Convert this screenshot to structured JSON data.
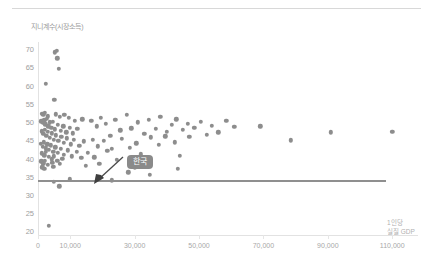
{
  "chart_data": {
    "type": "scatter",
    "title": "",
    "ylabel": "지니계수(시장소득)",
    "xlabel_lines": [
      "1인당",
      "실질 GDP"
    ],
    "xlabel": "1인당 실질 GDP",
    "xlim": [
      0,
      118000
    ],
    "ylim": [
      19,
      72
    ],
    "yticks": [
      70,
      65,
      60,
      55,
      50,
      45,
      40,
      35,
      30,
      25,
      20
    ],
    "xticks": [
      0,
      10000,
      30000,
      50000,
      70000,
      90000,
      110000
    ],
    "xticklabels": [
      "0",
      "10,000",
      "30,000",
      "50,000",
      "70,000",
      "90,000",
      "110,000"
    ],
    "grid": false,
    "legend": "none",
    "point_color": "#8d8d8d",
    "reference_line": {
      "orientation": "horizontal",
      "value": 34,
      "color": "#8f8f8f",
      "x_from": 0,
      "x_to": 108000
    },
    "annotations": [
      {
        "label": "한국",
        "target_x": 23000,
        "target_y": 34,
        "badge_color": "#8a8a8a",
        "text_color": "#ffffff"
      }
    ],
    "points": [
      [
        5200,
        69.2
      ],
      [
        5800,
        69.6
      ],
      [
        6000,
        67.5
      ],
      [
        6400,
        64.7
      ],
      [
        2400,
        60.6
      ],
      [
        5100,
        56.2
      ],
      [
        1300,
        52.3
      ],
      [
        1700,
        52.0
      ],
      [
        2200,
        52.5
      ],
      [
        3000,
        51.6
      ],
      [
        5500,
        52.1
      ],
      [
        6700,
        51.5
      ],
      [
        8200,
        52.0
      ],
      [
        9500,
        51.2
      ],
      [
        11500,
        50.3
      ],
      [
        13800,
        50.8
      ],
      [
        1000,
        50.2
      ],
      [
        1500,
        49.8
      ],
      [
        1900,
        50.5
      ],
      [
        2300,
        49.4
      ],
      [
        2700,
        50.9
      ],
      [
        3200,
        48.8
      ],
      [
        3600,
        49.9
      ],
      [
        4100,
        48.4
      ],
      [
        4600,
        50.1
      ],
      [
        5300,
        48.0
      ],
      [
        6100,
        49.3
      ],
      [
        7000,
        47.6
      ],
      [
        7800,
        48.9
      ],
      [
        8800,
        47.2
      ],
      [
        9800,
        48.5
      ],
      [
        10800,
        46.9
      ],
      [
        12200,
        48.2
      ],
      [
        1100,
        47.5
      ],
      [
        1600,
        46.8
      ],
      [
        2100,
        47.9
      ],
      [
        2600,
        46.2
      ],
      [
        3100,
        47.3
      ],
      [
        3700,
        45.7
      ],
      [
        4300,
        46.9
      ],
      [
        4900,
        45.2
      ],
      [
        5600,
        46.4
      ],
      [
        6300,
        44.8
      ],
      [
        7200,
        46.0
      ],
      [
        8000,
        44.3
      ],
      [
        9000,
        45.6
      ],
      [
        10200,
        43.9
      ],
      [
        11200,
        45.1
      ],
      [
        12800,
        43.5
      ],
      [
        14200,
        44.7
      ],
      [
        900,
        44.0
      ],
      [
        1400,
        43.3
      ],
      [
        1800,
        44.5
      ],
      [
        2400,
        42.8
      ],
      [
        2900,
        43.9
      ],
      [
        3400,
        42.4
      ],
      [
        4000,
        43.6
      ],
      [
        4700,
        41.9
      ],
      [
        5400,
        43.1
      ],
      [
        6200,
        41.5
      ],
      [
        7100,
        42.7
      ],
      [
        8100,
        41.0
      ],
      [
        9200,
        42.3
      ],
      [
        10500,
        40.6
      ],
      [
        12000,
        41.8
      ],
      [
        13500,
        40.2
      ],
      [
        1200,
        41.4
      ],
      [
        1900,
        40.9
      ],
      [
        2500,
        41.9
      ],
      [
        3300,
        40.4
      ],
      [
        4200,
        39.8
      ],
      [
        5000,
        40.6
      ],
      [
        6000,
        39.3
      ],
      [
        7500,
        40.0
      ],
      [
        1000,
        39.2
      ],
      [
        1600,
        38.7
      ],
      [
        2200,
        39.4
      ],
      [
        3000,
        38.2
      ],
      [
        4500,
        38.9
      ],
      [
        6800,
        38.5
      ],
      [
        1300,
        37.6
      ],
      [
        2000,
        37.1
      ],
      [
        4800,
        37.8
      ],
      [
        16500,
        50.4
      ],
      [
        18200,
        48.8
      ],
      [
        19500,
        51.2
      ],
      [
        21000,
        49.5
      ],
      [
        22500,
        46.3
      ],
      [
        24000,
        50.7
      ],
      [
        25500,
        47.8
      ],
      [
        27500,
        52.0
      ],
      [
        29000,
        48.3
      ],
      [
        31000,
        49.9
      ],
      [
        33000,
        46.8
      ],
      [
        34500,
        50.6
      ],
      [
        36500,
        48.1
      ],
      [
        38000,
        51.5
      ],
      [
        40000,
        47.4
      ],
      [
        41500,
        49.2
      ],
      [
        43000,
        50.8
      ],
      [
        45000,
        47.9
      ],
      [
        46500,
        49.6
      ],
      [
        48500,
        48.4
      ],
      [
        50500,
        50.1
      ],
      [
        52500,
        46.5
      ],
      [
        54000,
        49.0
      ],
      [
        56000,
        47.2
      ],
      [
        58500,
        50.4
      ],
      [
        61000,
        48.7
      ],
      [
        17000,
        45.1
      ],
      [
        18500,
        43.4
      ],
      [
        20500,
        44.8
      ],
      [
        23000,
        42.6
      ],
      [
        26000,
        45.5
      ],
      [
        28500,
        43.0
      ],
      [
        30500,
        44.2
      ],
      [
        35000,
        45.8
      ],
      [
        37500,
        43.7
      ],
      [
        39500,
        46.1
      ],
      [
        42500,
        44.5
      ],
      [
        47000,
        45.9
      ],
      [
        15500,
        41.6
      ],
      [
        17500,
        40.3
      ],
      [
        21500,
        42.1
      ],
      [
        24500,
        39.7
      ],
      [
        32000,
        41.2
      ],
      [
        44000,
        40.8
      ],
      [
        14800,
        38.0
      ],
      [
        19000,
        38.6
      ],
      [
        30000,
        37.4
      ],
      [
        43500,
        37.1
      ],
      [
        28000,
        36.2
      ],
      [
        34800,
        35.5
      ],
      [
        69000,
        48.9
      ],
      [
        78500,
        45.0
      ],
      [
        91000,
        47.2
      ],
      [
        110000,
        47.4
      ],
      [
        5000,
        33.6
      ],
      [
        9800,
        34.3
      ],
      [
        23000,
        34.0
      ],
      [
        6600,
        32.4
      ],
      [
        3400,
        21.5
      ]
    ]
  }
}
